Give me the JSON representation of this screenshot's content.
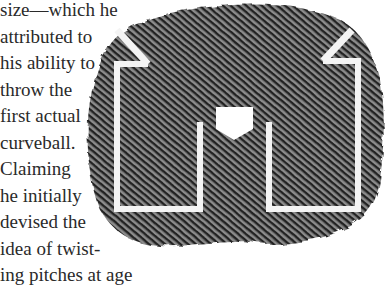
{
  "article": {
    "lines": [
      "size—which he",
      "attributed to",
      "his ability to",
      "throw the",
      "first actual",
      "curveball.",
      "Claiming",
      "he initially",
      "devised the",
      "idea of twist-",
      "ing pitches at age"
    ]
  },
  "figure": {
    "texture_color": "#3a3a3a",
    "line_color": "#f4f4f4"
  }
}
